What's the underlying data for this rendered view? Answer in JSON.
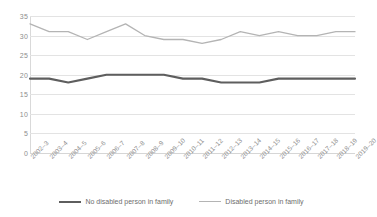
{
  "chart_data": {
    "type": "line",
    "title": "",
    "xlabel": "",
    "ylabel": "",
    "ylim": [
      0,
      35
    ],
    "yticks": [
      0,
      5,
      10,
      15,
      20,
      25,
      30,
      35
    ],
    "grid": true,
    "legend_position": "bottom",
    "categories": [
      "2002–3",
      "2003–4",
      "2004–5",
      "2005–6",
      "2006–7",
      "2007–8",
      "2008–9",
      "2009–10",
      "2010–11",
      "2011–12",
      "2012–13",
      "2013–14",
      "2014–15",
      "2015–16",
      "2016–17",
      "2017–18",
      "2018–19",
      "2019–20"
    ],
    "series": [
      {
        "name": "No disabled person in family",
        "color": "#5e5e5e",
        "values": [
          19,
          19,
          18,
          19,
          20,
          20,
          20,
          20,
          19,
          19,
          18,
          18,
          18,
          19,
          19,
          19,
          19,
          19
        ]
      },
      {
        "name": "Disabled person in family",
        "color": "#b4b4b4",
        "values": [
          33,
          31,
          31,
          29,
          31,
          33,
          30,
          29,
          29,
          28,
          29,
          31,
          30,
          31,
          30,
          30,
          31,
          31
        ]
      }
    ]
  },
  "legend": {
    "items": [
      {
        "label": "No disabled person in family"
      },
      {
        "label": "Disabled person in family"
      }
    ]
  },
  "colors": {
    "grid": "#e3e3e3",
    "tick_text": "#8d8d8d",
    "legend_text": "#6d6d6d",
    "background": "#ffffff"
  }
}
